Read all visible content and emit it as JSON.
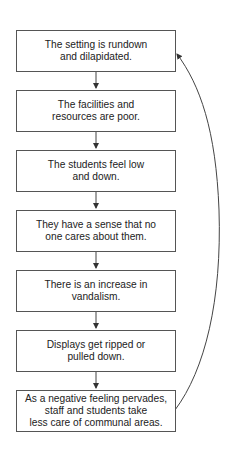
{
  "diagram": {
    "type": "cycle-flowchart",
    "steps": [
      {
        "text": "The setting is rundown\nand dilapidated."
      },
      {
        "text": "The facilities and\nresources are poor."
      },
      {
        "text": "The students feel low\nand down."
      },
      {
        "text": "They have a sense that no\none cares about them."
      },
      {
        "text": "There is an increase in\nvandalism."
      },
      {
        "text": "Displays get ripped or\npulled down."
      },
      {
        "text": "As a negative feeling pervades,\nstaff and students take\nless care of communal areas."
      }
    ],
    "feedback_arrow": {
      "from": "step-7",
      "to": "step-1"
    },
    "colors": {
      "line": "#444444",
      "border": "#555555",
      "text": "#222222"
    }
  }
}
